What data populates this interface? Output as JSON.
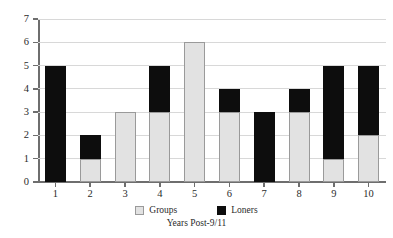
{
  "chart_data": {
    "type": "bar",
    "stacked": true,
    "title": "",
    "xlabel": "Years Post-9/11",
    "ylabel": "",
    "categories": [
      "1",
      "2",
      "3",
      "4",
      "5",
      "6",
      "7",
      "8",
      "9",
      "10"
    ],
    "series": [
      {
        "name": "Groups",
        "color": "#e2e2e2",
        "values": [
          0,
          1,
          3,
          3,
          6,
          3,
          0,
          3,
          1,
          2
        ]
      },
      {
        "name": "Loners",
        "color": "#0d0d0d",
        "values": [
          5,
          1,
          0,
          2,
          0,
          1,
          3,
          1,
          4,
          3
        ]
      }
    ],
    "totals": [
      5,
      2,
      3,
      5,
      6,
      4,
      3,
      4,
      5,
      5
    ],
    "ylim": [
      0,
      7
    ],
    "yticks": [
      "0",
      "1",
      "2",
      "3",
      "4",
      "5",
      "6",
      "7"
    ],
    "grid": true,
    "legend_position": "bottom"
  },
  "legend": {
    "items": [
      {
        "label": "Groups",
        "swatch": "groups-swatch"
      },
      {
        "label": "Loners",
        "swatch": "loners-swatch"
      }
    ]
  }
}
